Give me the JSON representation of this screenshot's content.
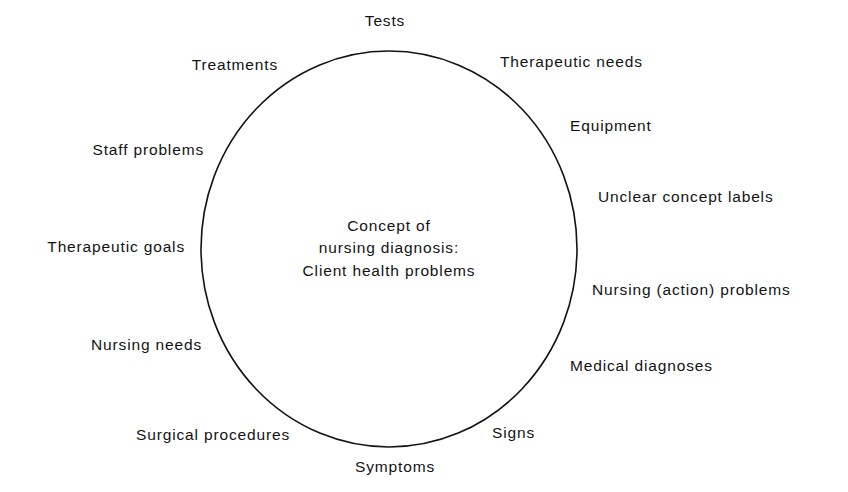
{
  "diagram": {
    "kind": "concept-circle-diagram",
    "background_color": "#ffffff",
    "stroke_color": "#131313",
    "text_color": "#131313",
    "center": {
      "lines": [
        "Concept of",
        "nursing diagnosis:",
        "Client health problems"
      ]
    },
    "peripheral_labels": [
      {
        "id": "tests",
        "text": "Tests",
        "x": 385,
        "y": 21,
        "anchor": "center"
      },
      {
        "id": "therapeutic-needs",
        "text": "Therapeutic needs",
        "x": 500,
        "y": 62,
        "anchor": "left"
      },
      {
        "id": "equipment",
        "text": "Equipment",
        "x": 570,
        "y": 126,
        "anchor": "left"
      },
      {
        "id": "unclear-concept-labels",
        "text": "Unclear concept labels",
        "x": 598,
        "y": 197,
        "anchor": "left"
      },
      {
        "id": "nursing-action-problems",
        "text": "Nursing (action) problems",
        "x": 592,
        "y": 290,
        "anchor": "left"
      },
      {
        "id": "medical-diagnoses",
        "text": "Medical diagnoses",
        "x": 570,
        "y": 366,
        "anchor": "left"
      },
      {
        "id": "signs",
        "text": "Signs",
        "x": 492,
        "y": 433,
        "anchor": "left"
      },
      {
        "id": "symptoms",
        "text": "Symptoms",
        "x": 395,
        "y": 467,
        "anchor": "center"
      },
      {
        "id": "surgical-procedures",
        "text": "Surgical procedures",
        "x": 290,
        "y": 435,
        "anchor": "right"
      },
      {
        "id": "nursing-needs",
        "text": "Nursing needs",
        "x": 202,
        "y": 345,
        "anchor": "right"
      },
      {
        "id": "therapeutic-goals",
        "text": "Therapeutic goals",
        "x": 185,
        "y": 247,
        "anchor": "right"
      },
      {
        "id": "staff-problems",
        "text": "Staff problems",
        "x": 204,
        "y": 150,
        "anchor": "right"
      },
      {
        "id": "treatments",
        "text": "Treatments",
        "x": 278,
        "y": 65,
        "anchor": "right"
      }
    ],
    "ellipse": {
      "cx": 389,
      "cy": 249,
      "rx": 188,
      "ry": 198,
      "stroke_width": 1.6
    }
  }
}
